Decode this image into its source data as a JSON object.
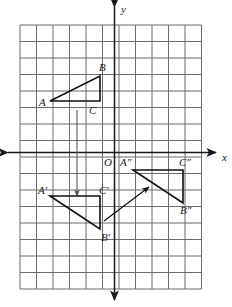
{
  "figure": {
    "grid": {
      "cell_size_px": 16.5,
      "left_px": 20,
      "top_px": 25,
      "cols": 11,
      "rows": 16,
      "line_color": "#6b6b6b",
      "show_grid": true
    },
    "axes": {
      "origin_px": {
        "x": 114.5,
        "y": 152.5
      },
      "x_axis_label": "x",
      "y_axis_label": "y",
      "origin_label": "O",
      "axis_color": "#1a1a1a",
      "x_label_pos": {
        "x": 222,
        "y": 161
      },
      "y_label_pos": {
        "x": 121,
        "y": 13
      },
      "origin_label_pos": {
        "x": 104,
        "y": 166
      }
    },
    "shapes": [
      {
        "name": "triangle-abc",
        "vertices": [
          {
            "label": "A",
            "px": {
              "x": 50,
              "y": 101
            },
            "label_px": {
              "x": 39,
              "y": 106
            }
          },
          {
            "label": "B",
            "px": {
              "x": 100,
              "y": 76
            },
            "label_px": {
              "x": 99,
              "y": 71
            }
          },
          {
            "label": "C",
            "px": {
              "x": 100,
              "y": 101
            },
            "label_px": {
              "x": 89,
              "y": 114
            }
          }
        ],
        "closed": true,
        "stroke": "#111111",
        "stroke_width": 1.6
      },
      {
        "name": "triangle-a-prime-b-prime-c-prime",
        "vertices": [
          {
            "label": "A′",
            "px": {
              "x": 50,
              "y": 196
            },
            "label_px": {
              "x": 38,
              "y": 194
            }
          },
          {
            "label": "C′",
            "px": {
              "x": 100,
              "y": 196
            },
            "label_px": {
              "x": 99,
              "y": 194
            }
          },
          {
            "label": "B′",
            "px": {
              "x": 100,
              "y": 229
            },
            "label_px": {
              "x": 101,
              "y": 241
            }
          }
        ],
        "closed": true,
        "stroke": "#111111",
        "stroke_width": 1.6
      },
      {
        "name": "triangle-a-double-prime-b-double-prime-c-double-prime",
        "vertices": [
          {
            "label": "A″",
            "px": {
              "x": 133,
              "y": 170
            },
            "label_px": {
              "x": 120,
              "y": 166
            }
          },
          {
            "label": "C″",
            "px": {
              "x": 183,
              "y": 170
            },
            "label_px": {
              "x": 179,
              "y": 166
            }
          },
          {
            "label": "B″",
            "px": {
              "x": 183,
              "y": 203
            },
            "label_px": {
              "x": 180,
              "y": 214
            }
          }
        ],
        "closed": true,
        "stroke": "#111111",
        "stroke_width": 1.6
      }
    ],
    "arrows": [
      {
        "name": "translation-arrow-down",
        "from_px": {
          "x": 77,
          "y": 110
        },
        "to_px": {
          "x": 77,
          "y": 196
        },
        "stroke": "#5a5a5a",
        "stroke_width": 1.1
      },
      {
        "name": "translation-arrow-diagonal",
        "from_px": {
          "x": 104,
          "y": 221
        },
        "to_px": {
          "x": 149,
          "y": 187
        },
        "stroke": "#111111",
        "stroke_width": 1.2
      }
    ]
  },
  "chart_data": {
    "type": "scatter",
    "xlabel": "x",
    "ylabel": "y",
    "xlim": [
      -5.7,
      6.0
    ],
    "ylim": [
      -8.0,
      7.7
    ],
    "grid": true,
    "legend": "none",
    "series": [
      {
        "name": "Triangle ABC",
        "points": [
          {
            "label": "A",
            "x": -4,
            "y": 3
          },
          {
            "label": "B",
            "x": -1,
            "y": 4.5
          },
          {
            "label": "C",
            "x": -1,
            "y": 3
          }
        ]
      },
      {
        "name": "Triangle A'B'C'",
        "points": [
          {
            "label": "A′",
            "x": -4,
            "y": -2.5
          },
          {
            "label": "C′",
            "x": -1,
            "y": -2.5
          },
          {
            "label": "B′",
            "x": -1,
            "y": -4.5
          }
        ]
      },
      {
        "name": "Triangle A''B''C''",
        "points": [
          {
            "label": "A″",
            "x": 1,
            "y": -1
          },
          {
            "label": "C″",
            "x": 4,
            "y": -1
          },
          {
            "label": "B″",
            "x": 4,
            "y": -3
          }
        ]
      }
    ],
    "annotations": [
      {
        "text": "translation arrow down",
        "from": [
          -2.3,
          2.5
        ],
        "to": [
          -2.3,
          -2.5
        ]
      },
      {
        "text": "translation arrow diagonal",
        "from": [
          -0.6,
          -4.1
        ],
        "to": [
          2.1,
          -2.1
        ]
      }
    ]
  }
}
